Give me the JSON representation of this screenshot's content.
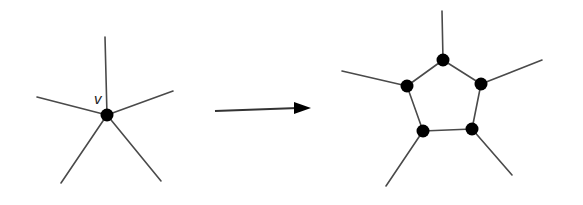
{
  "diagram": {
    "colors": {
      "edge": "#4a4a4a",
      "node": "#000000",
      "background": "#ffffff"
    },
    "left_graph": {
      "center": {
        "label": "v",
        "x": 107,
        "y": 115
      },
      "label_pos": {
        "x": 94,
        "y": 104
      },
      "edge_ends": [
        {
          "x": 105,
          "y": 37
        },
        {
          "x": 173,
          "y": 91
        },
        {
          "x": 161,
          "y": 181
        },
        {
          "x": 61,
          "y": 183
        },
        {
          "x": 37,
          "y": 97
        }
      ]
    },
    "arrow": {
      "x1": 215,
      "y1": 111,
      "x2": 298,
      "y2": 108,
      "head_tip_x": 311,
      "head_tip_y": 108
    },
    "right_graph": {
      "cycle_nodes": [
        {
          "name": "top",
          "x": 443,
          "y": 60,
          "end": {
            "x": 442,
            "y": 11
          }
        },
        {
          "name": "right",
          "x": 481,
          "y": 84,
          "end": {
            "x": 542,
            "y": 60
          }
        },
        {
          "name": "bottom-right",
          "x": 472,
          "y": 129,
          "end": {
            "x": 512,
            "y": 175
          }
        },
        {
          "name": "bottom-left",
          "x": 423,
          "y": 131,
          "end": {
            "x": 386,
            "y": 186
          }
        },
        {
          "name": "left",
          "x": 407,
          "y": 86,
          "end": {
            "x": 342,
            "y": 71
          }
        }
      ]
    }
  }
}
